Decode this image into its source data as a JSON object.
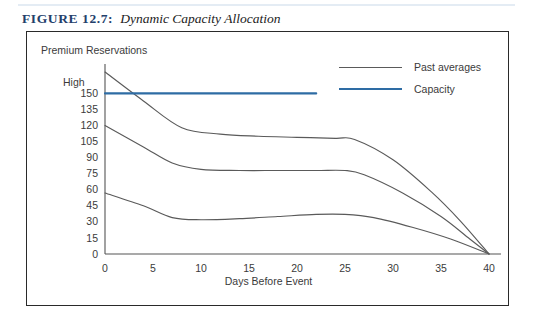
{
  "figure": {
    "label": "FIGURE 12.7:",
    "title": "Dynamic Capacity Allocation",
    "label_color": "#23406b",
    "rule_color": "#e4ecf4"
  },
  "legend": {
    "position": "top-right",
    "items": [
      {
        "label": "Past averages",
        "color": "#5a5a5a"
      },
      {
        "label": "Capacity",
        "color": "#2e6ca4"
      }
    ]
  },
  "chart_data": {
    "type": "line",
    "title": "Premium Reservations",
    "xlabel": "Days Before Event",
    "ylabel": "Premium Reservations",
    "xlim": [
      0,
      40
    ],
    "ylim": [
      0,
      170
    ],
    "grid": false,
    "xticks": [
      0,
      5,
      10,
      15,
      20,
      25,
      30,
      35,
      40
    ],
    "xtick_labels": [
      "0",
      "5",
      "10",
      "15",
      "20",
      "25",
      "30",
      "35",
      "40"
    ],
    "yticks": [
      0,
      15,
      30,
      45,
      60,
      75,
      90,
      105,
      120,
      135,
      150
    ],
    "ytick_labels": [
      "0",
      "15",
      "30",
      "45",
      "60",
      "75",
      "90",
      "105",
      "120",
      "135",
      "150"
    ],
    "ytop_label": "High",
    "ytop_value": 170,
    "series": [
      {
        "name": "Past averages (upper)",
        "color": "#5a5a5a",
        "x": [
          0,
          4,
          8,
          12,
          16,
          20,
          24,
          26,
          30,
          34,
          37,
          40
        ],
        "y": [
          170,
          143,
          118,
          112,
          110,
          109,
          108,
          107,
          88,
          58,
          31,
          0
        ]
      },
      {
        "name": "Past averages (middle)",
        "color": "#5a5a5a",
        "x": [
          0,
          4,
          7,
          10,
          14,
          18,
          22,
          25,
          27,
          31,
          35,
          38,
          40
        ],
        "y": [
          120,
          100,
          85,
          79,
          78,
          78,
          78,
          78,
          74,
          57,
          35,
          14,
          0
        ]
      },
      {
        "name": "Past averages (lower)",
        "color": "#5a5a5a",
        "x": [
          0,
          4,
          7,
          10,
          14,
          18,
          22,
          25,
          28,
          32,
          36,
          40
        ],
        "y": [
          57,
          45,
          34,
          32,
          33,
          35,
          37,
          37,
          34,
          25,
          14,
          0
        ]
      },
      {
        "name": "Capacity",
        "color": "#2e6ca4",
        "x": [
          0,
          22
        ],
        "y": [
          150,
          150
        ]
      }
    ]
  }
}
